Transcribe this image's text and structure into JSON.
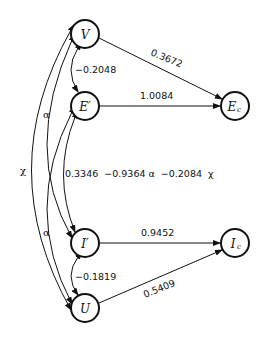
{
  "diagram": {
    "type": "path-diagram",
    "nodes": {
      "V": {
        "label": "V"
      },
      "Ep": {
        "label": "E′"
      },
      "Ip": {
        "label": "I′"
      },
      "U": {
        "label": "U"
      },
      "Ec": {
        "label": "E",
        "sub": "c"
      },
      "Ic": {
        "label": "I",
        "sub": "c"
      }
    },
    "paths": {
      "V_Ec": "0.3672",
      "Ep_Ec": "1.0084",
      "Ip_Ic": "0.9452",
      "U_Ic": "0.5409"
    },
    "correlations": {
      "V_Ep": "−0.2048",
      "Ip_U": "−0.1819",
      "Ep_Ip": "0.3346  −0.9364 α  −0.2084  χ",
      "alpha_upper": "α",
      "alpha_lower": "α",
      "chi": "χ"
    }
  }
}
